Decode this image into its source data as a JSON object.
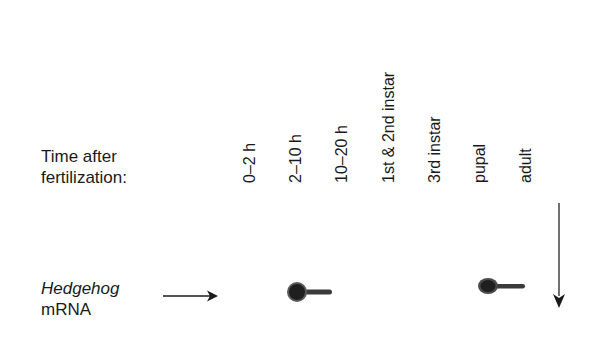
{
  "header": {
    "time_label_line1": "Time after",
    "time_label_line2": "fertilization:"
  },
  "gene": {
    "name": "Hedgehog",
    "suffix": "mRNA"
  },
  "lanes": [
    {
      "label": "0–2 h",
      "signal": false
    },
    {
      "label": "2–10 h",
      "signal": true
    },
    {
      "label": "10–20 h",
      "signal": false
    },
    {
      "label": "1st & 2nd instar",
      "signal": false
    },
    {
      "label": "3rd instar",
      "signal": false
    },
    {
      "label": "pupal",
      "signal": true
    },
    {
      "label": "adult",
      "signal": false
    }
  ],
  "colors": {
    "ink": "#1a1a1a",
    "band": "#2a2a2a"
  }
}
